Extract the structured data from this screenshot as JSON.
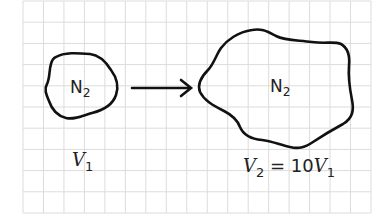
{
  "diagram": {
    "background": "graph paper grid",
    "grid": {
      "color": "#dcdcdc",
      "x_start": 23,
      "x_end": 371,
      "y_start": 1,
      "y_end": 213,
      "cell_size": 21
    },
    "stroke_color": "#111111",
    "text_color": "#222222",
    "left_region": {
      "gas": "N",
      "gas_subscript": "2",
      "volume_symbol": "V",
      "volume_subscript": "1"
    },
    "arrow": {
      "direction": "right",
      "meaning": "expansion"
    },
    "right_region": {
      "gas": "N",
      "gas_subscript": "2",
      "volume_symbol": "V",
      "volume_subscript": "2",
      "relation_equals": " = 10",
      "relation_symbol": "V",
      "relation_subscript": "1"
    }
  }
}
